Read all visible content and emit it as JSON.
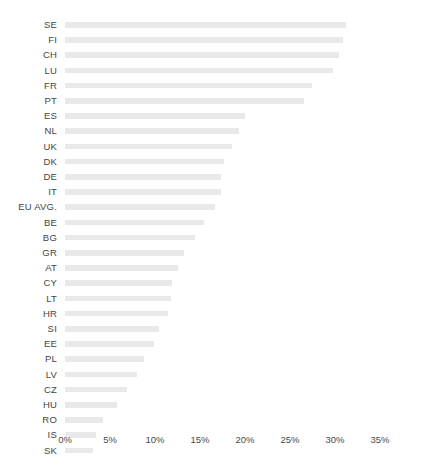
{
  "chart_data": {
    "type": "bar",
    "orientation": "horizontal",
    "title": "",
    "subtitle": "",
    "xlabel": "",
    "ylabel": "",
    "xlim": [
      0,
      35
    ],
    "grid": false,
    "legend": false,
    "bar_color": "#e9e9e9",
    "value_suffix": "%",
    "xticks": [
      {
        "label": "0%",
        "value": 0
      },
      {
        "label": "5%",
        "value": 5
      },
      {
        "label": "10%",
        "value": 10
      },
      {
        "label": "15%",
        "value": 15
      },
      {
        "label": "20%",
        "value": 20
      },
      {
        "label": "25%",
        "value": 25
      },
      {
        "label": "30%",
        "value": 30
      },
      {
        "label": "35%",
        "value": 35
      }
    ],
    "categories": [
      "SE",
      "FI",
      "CH",
      "LU",
      "FR",
      "PT",
      "ES",
      "NL",
      "UK",
      "DK",
      "DE",
      "IT",
      "EU AVG.",
      "BE",
      "BG",
      "GR",
      "AT",
      "CY",
      "LT",
      "HR",
      "SI",
      "EE",
      "PL",
      "LV",
      "CZ",
      "HU",
      "RO",
      "IS",
      "SK"
    ],
    "values": [
      31.2,
      30.9,
      30.4,
      29.8,
      27.4,
      26.6,
      20.0,
      19.3,
      18.6,
      17.7,
      17.3,
      17.3,
      16.7,
      15.4,
      14.4,
      13.2,
      12.6,
      11.9,
      11.8,
      11.4,
      10.4,
      9.9,
      8.8,
      8.0,
      6.9,
      5.8,
      4.2,
      3.4,
      3.1
    ],
    "bars": [
      {
        "category": "SE",
        "value": 31.2
      },
      {
        "category": "FI",
        "value": 30.9
      },
      {
        "category": "CH",
        "value": 30.4
      },
      {
        "category": "LU",
        "value": 29.8
      },
      {
        "category": "FR",
        "value": 27.4
      },
      {
        "category": "PT",
        "value": 26.6
      },
      {
        "category": "ES",
        "value": 20.0
      },
      {
        "category": "NL",
        "value": 19.3
      },
      {
        "category": "UK",
        "value": 18.6
      },
      {
        "category": "DK",
        "value": 17.7
      },
      {
        "category": "DE",
        "value": 17.3
      },
      {
        "category": "IT",
        "value": 17.3
      },
      {
        "category": "EU AVG.",
        "value": 16.7
      },
      {
        "category": "BE",
        "value": 15.4
      },
      {
        "category": "BG",
        "value": 14.4
      },
      {
        "category": "GR",
        "value": 13.2
      },
      {
        "category": "AT",
        "value": 12.6
      },
      {
        "category": "CY",
        "value": 11.9
      },
      {
        "category": "LT",
        "value": 11.8
      },
      {
        "category": "HR",
        "value": 11.4
      },
      {
        "category": "SI",
        "value": 10.4
      },
      {
        "category": "EE",
        "value": 9.9
      },
      {
        "category": "PL",
        "value": 8.8
      },
      {
        "category": "LV",
        "value": 8.0
      },
      {
        "category": "CZ",
        "value": 6.9
      },
      {
        "category": "HU",
        "value": 5.8
      },
      {
        "category": "RO",
        "value": 4.2
      },
      {
        "category": "IS",
        "value": 3.4
      },
      {
        "category": "SK",
        "value": 3.1
      }
    ]
  }
}
